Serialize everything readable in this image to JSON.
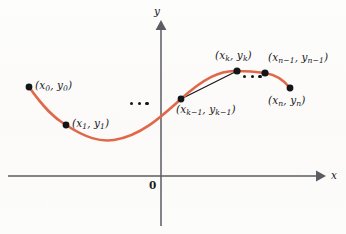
{
  "figure": {
    "background_color": "#fcfbfa",
    "curve_color": "#e0684a",
    "chord_color": "#121316",
    "axis_color": "#5b5d62",
    "point_color": "#141518",
    "text_color": "#18191b"
  },
  "axes": {
    "x_label": "x",
    "y_label": "y",
    "origin_label": "0",
    "x_axis_y": 176,
    "y_axis_x": 161,
    "x_arrow_tip_x": 322,
    "y_arrow_tip_y": 24
  },
  "points": [
    {
      "id": "p0",
      "label_open": "(",
      "x_var": "x",
      "x_sub": "0",
      "y_var": "y",
      "y_sub": "0",
      "label_close": ")",
      "label_text": "(x0, y0)",
      "cx": 29,
      "cy": 87,
      "label_x": 35,
      "label_y": 80,
      "label_align": "left"
    },
    {
      "id": "p1",
      "label_open": "(",
      "x_var": "x",
      "x_sub": "1",
      "y_var": "y",
      "y_sub": "1",
      "label_close": ")",
      "label_text": "(x1, y1)",
      "cx": 66,
      "cy": 125,
      "label_x": 72,
      "label_y": 118,
      "label_align": "left"
    },
    {
      "id": "pk-1",
      "label_open": "(",
      "x_var": "x",
      "x_sub": "k−1",
      "y_var": "y",
      "y_sub": "k−1",
      "label_close": ")",
      "label_text": "(xk−1, yk−1)",
      "cx": 181,
      "cy": 99,
      "label_x": 176,
      "label_y": 104,
      "label_align": "left"
    },
    {
      "id": "pk",
      "label_open": "(",
      "x_var": "x",
      "x_sub": "k",
      "y_var": "y",
      "y_sub": "k",
      "label_close": ")",
      "label_text": "(xk, yk)",
      "cx": 237,
      "cy": 71,
      "label_x": 215,
      "label_y": 50,
      "label_align": "left"
    },
    {
      "id": "pn-1",
      "label_open": "(",
      "x_var": "x",
      "x_sub": "n−1",
      "y_var": "y",
      "y_sub": "n−1",
      "label_close": ")",
      "label_text": "(xn−1, yn−1)",
      "cx": 265,
      "cy": 73,
      "label_x": 268,
      "label_y": 52,
      "label_align": "left"
    },
    {
      "id": "pn",
      "label_open": "(",
      "x_var": "x",
      "x_sub": "n",
      "y_var": "y",
      "y_sub": "n",
      "label_close": ")",
      "label_text": "(xn, yn)",
      "cx": 290,
      "cy": 88,
      "label_x": 268,
      "label_y": 95,
      "label_align": "left"
    }
  ],
  "ellipses": [
    {
      "id": "ellipsis-left",
      "x": 130,
      "y": 104,
      "count": 3
    },
    {
      "id": "ellipsis-right",
      "x": 243,
      "y": 77,
      "count": 3
    }
  ],
  "curve": {
    "path": "M 29 87 C 44 108, 54 118, 66 125 C 86 138, 100 142, 114 140 C 140 136, 160 118, 181 99 C 203 79, 220 70, 237 71 C 250 71, 258 72, 265 73 C 277 75, 284 80, 290 88",
    "stroke_width": 2.6
  },
  "chord": {
    "from": "pk-1",
    "to": "pk",
    "x1": 181,
    "y1": 99,
    "x2": 237,
    "y2": 71,
    "stroke_width": 1.2
  }
}
